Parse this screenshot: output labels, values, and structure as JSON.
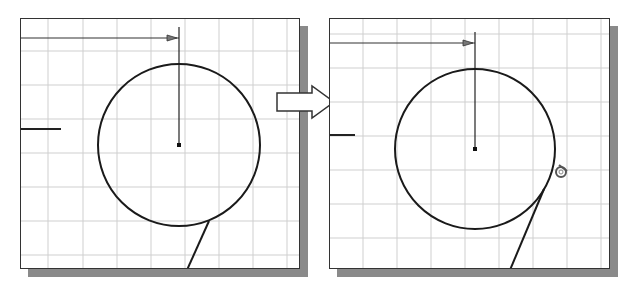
{
  "figure": {
    "colors": {
      "background": "#ffffff",
      "grid": "#cfcfcf",
      "sketch": "#1a1a1a",
      "border": "#333333",
      "shadow": "#8a8a8a",
      "arrow_fill": "#ffffff",
      "arrow_stroke": "#333333"
    }
  },
  "panels": [
    {
      "id": "before",
      "label": "",
      "grid_spacing": 34,
      "circle": {
        "cx": 158,
        "cy": 126,
        "r": 81
      },
      "center_marker": true,
      "vertical_dimension_line": {
        "x": 158,
        "y1": 8,
        "y2": 126
      },
      "horizontal_dimension_line": {
        "y": 18,
        "x1": 0,
        "x2": 158
      },
      "short_line": {
        "y": 110,
        "x1": 0,
        "x2": 40
      },
      "tangent_line": {
        "x1": 188,
        "y1": 202,
        "x2": 166,
        "y2": 250
      }
    },
    {
      "id": "after",
      "label": "",
      "grid_spacing": 34,
      "circle": {
        "cx": 145,
        "cy": 130,
        "r": 80
      },
      "center_marker": true,
      "vertical_dimension_line": {
        "x": 145,
        "y1": 13,
        "y2": 130
      },
      "horizontal_dimension_line": {
        "y": 24,
        "x1": 0,
        "x2": 145
      },
      "short_line": {
        "y": 116,
        "x1": 0,
        "x2": 25
      },
      "tangent_line": {
        "x1": 214,
        "y1": 170,
        "x2": 180,
        "y2": 250
      },
      "tangent_cursor_icon": {
        "x": 231,
        "y": 150
      }
    }
  ],
  "transition_arrow": {
    "direction": "right"
  }
}
